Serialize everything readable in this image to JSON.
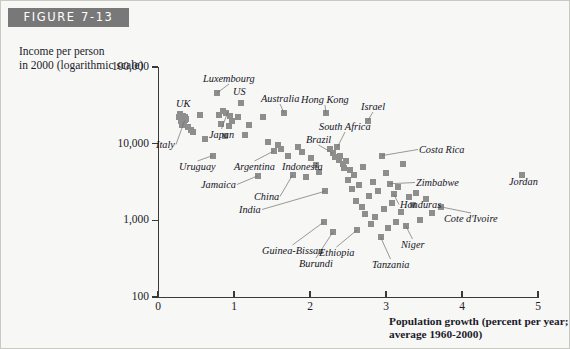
{
  "figure": {
    "badge": "FIGURE 7-13"
  },
  "chart_data": {
    "type": "scatter",
    "title": "FIGURE 7-13",
    "ylabel": "Income per person\nin 2000 (logarithmic scale)",
    "xlabel": "Population growth (percent per year;\naverage 1960-2000)",
    "xlim": [
      0,
      5
    ],
    "ylim": [
      100,
      100000
    ],
    "yscale": "log",
    "grid": false,
    "legend": null,
    "xticks": [
      "0",
      "1",
      "2",
      "3",
      "4",
      "5"
    ],
    "yticks": [
      "100",
      "1,000",
      "10,000",
      "100,000"
    ],
    "marker_color": "#8e8e8e",
    "labeled_points": [
      {
        "name": "Luxembourg",
        "x": 0.78,
        "y": 46000,
        "lx": 202,
        "ly": 72,
        "anchor": "start"
      },
      {
        "name": "UK",
        "x": 0.31,
        "y": 24500,
        "lx": 175,
        "ly": 97,
        "anchor": "start"
      },
      {
        "name": "US",
        "x": 1.09,
        "y": 34000,
        "lx": 232,
        "ly": 85,
        "anchor": "start"
      },
      {
        "name": "Australia",
        "x": 1.66,
        "y": 25000,
        "lx": 260,
        "ly": 92,
        "anchor": "start"
      },
      {
        "name": "Hong Kong",
        "x": 2.21,
        "y": 25000,
        "lx": 300,
        "ly": 93,
        "anchor": "start"
      },
      {
        "name": "Israel",
        "x": 2.76,
        "y": 20000,
        "lx": 360,
        "ly": 100,
        "anchor": "start"
      },
      {
        "name": "Italy",
        "x": 0.35,
        "y": 20000,
        "lx": 155,
        "ly": 138,
        "anchor": "start"
      },
      {
        "name": "Japan",
        "x": 0.92,
        "y": 26000,
        "lx": 208,
        "ly": 128,
        "anchor": "start"
      },
      {
        "name": "South Africa",
        "x": 2.36,
        "y": 9000,
        "lx": 318,
        "ly": 120,
        "anchor": "start"
      },
      {
        "name": "Brazil",
        "x": 2.3,
        "y": 7500,
        "lx": 305,
        "ly": 133,
        "anchor": "start"
      },
      {
        "name": "Costa Rica",
        "x": 2.95,
        "y": 7000,
        "lx": 418,
        "ly": 143,
        "anchor": "start"
      },
      {
        "name": "Uruguay",
        "x": 0.72,
        "y": 7000,
        "lx": 178,
        "ly": 160,
        "anchor": "start"
      },
      {
        "name": "Argentina",
        "x": 1.52,
        "y": 8000,
        "lx": 233,
        "ly": 160,
        "anchor": "start"
      },
      {
        "name": "Indonesia",
        "x": 2.01,
        "y": 6500,
        "lx": 281,
        "ly": 160,
        "anchor": "start"
      },
      {
        "name": "Zimbabwe",
        "x": 3.05,
        "y": 3000,
        "lx": 415,
        "ly": 176,
        "anchor": "start"
      },
      {
        "name": "Jamaica",
        "x": 1.31,
        "y": 3800,
        "lx": 200,
        "ly": 178,
        "anchor": "start"
      },
      {
        "name": "China",
        "x": 1.77,
        "y": 3900,
        "lx": 253,
        "ly": 190,
        "anchor": "start"
      },
      {
        "name": "Jordan",
        "x": 4.79,
        "y": 3900,
        "lx": 508,
        "ly": 175,
        "anchor": "start"
      },
      {
        "name": "Honduras",
        "x": 3.1,
        "y": 2200,
        "lx": 399,
        "ly": 198,
        "anchor": "start"
      },
      {
        "name": "India",
        "x": 2.2,
        "y": 2400,
        "lx": 238,
        "ly": 203,
        "anchor": "start"
      },
      {
        "name": "Cote d'Ivoire",
        "x": 3.72,
        "y": 1500,
        "lx": 443,
        "ly": 212,
        "anchor": "start"
      },
      {
        "name": "Niger",
        "x": 3.26,
        "y": 850,
        "lx": 400,
        "ly": 238,
        "anchor": "start"
      },
      {
        "name": "Guinea-Bissau",
        "x": 2.18,
        "y": 950,
        "lx": 261,
        "ly": 244,
        "anchor": "start"
      },
      {
        "name": "Ethiopia",
        "x": 2.62,
        "y": 750,
        "lx": 318,
        "ly": 246,
        "anchor": "start"
      },
      {
        "name": "Burundi",
        "x": 2.3,
        "y": 700,
        "lx": 298,
        "ly": 257,
        "anchor": "start"
      },
      {
        "name": "Tanzania",
        "x": 2.93,
        "y": 600,
        "lx": 371,
        "ly": 258,
        "anchor": "start"
      }
    ],
    "points": [
      {
        "x": 0.27,
        "y": 22000
      },
      {
        "x": 0.3,
        "y": 19500
      },
      {
        "x": 0.33,
        "y": 23000
      },
      {
        "x": 0.35,
        "y": 20500
      },
      {
        "x": 0.37,
        "y": 21000
      },
      {
        "x": 0.31,
        "y": 17500
      },
      {
        "x": 0.29,
        "y": 24500
      },
      {
        "x": 0.4,
        "y": 16500
      },
      {
        "x": 0.43,
        "y": 15000
      },
      {
        "x": 0.34,
        "y": 18500
      },
      {
        "x": 0.36,
        "y": 22500
      },
      {
        "x": 0.46,
        "y": 14000
      },
      {
        "x": 0.55,
        "y": 24000
      },
      {
        "x": 0.62,
        "y": 11500
      },
      {
        "x": 0.72,
        "y": 7000
      },
      {
        "x": 0.78,
        "y": 46000
      },
      {
        "x": 0.8,
        "y": 24000
      },
      {
        "x": 0.86,
        "y": 26500
      },
      {
        "x": 0.9,
        "y": 25000
      },
      {
        "x": 0.95,
        "y": 23000
      },
      {
        "x": 0.98,
        "y": 20000
      },
      {
        "x": 0.83,
        "y": 18000
      },
      {
        "x": 0.88,
        "y": 12500
      },
      {
        "x": 0.93,
        "y": 17000
      },
      {
        "x": 1.09,
        "y": 34000
      },
      {
        "x": 1.05,
        "y": 22000
      },
      {
        "x": 1.15,
        "y": 13000
      },
      {
        "x": 1.2,
        "y": 17500
      },
      {
        "x": 1.31,
        "y": 3800
      },
      {
        "x": 1.38,
        "y": 22000
      },
      {
        "x": 1.45,
        "y": 10500
      },
      {
        "x": 1.52,
        "y": 8000
      },
      {
        "x": 1.58,
        "y": 9500
      },
      {
        "x": 1.66,
        "y": 25000
      },
      {
        "x": 1.62,
        "y": 8500
      },
      {
        "x": 1.71,
        "y": 7000
      },
      {
        "x": 1.77,
        "y": 3900
      },
      {
        "x": 1.84,
        "y": 9000
      },
      {
        "x": 1.9,
        "y": 7800
      },
      {
        "x": 1.95,
        "y": 3700
      },
      {
        "x": 2.01,
        "y": 6500
      },
      {
        "x": 2.08,
        "y": 5200
      },
      {
        "x": 2.12,
        "y": 4300
      },
      {
        "x": 2.18,
        "y": 950
      },
      {
        "x": 2.2,
        "y": 2400
      },
      {
        "x": 2.21,
        "y": 25000
      },
      {
        "x": 2.26,
        "y": 8500
      },
      {
        "x": 2.3,
        "y": 7500
      },
      {
        "x": 2.3,
        "y": 700
      },
      {
        "x": 2.33,
        "y": 6800
      },
      {
        "x": 2.36,
        "y": 9000
      },
      {
        "x": 2.38,
        "y": 6200
      },
      {
        "x": 2.4,
        "y": 7000
      },
      {
        "x": 2.43,
        "y": 5500
      },
      {
        "x": 2.45,
        "y": 4800
      },
      {
        "x": 2.48,
        "y": 6000
      },
      {
        "x": 2.5,
        "y": 3400
      },
      {
        "x": 2.52,
        "y": 4500
      },
      {
        "x": 2.55,
        "y": 2600
      },
      {
        "x": 2.58,
        "y": 3900
      },
      {
        "x": 2.62,
        "y": 750
      },
      {
        "x": 2.6,
        "y": 1800
      },
      {
        "x": 2.65,
        "y": 2900
      },
      {
        "x": 2.68,
        "y": 1500
      },
      {
        "x": 2.7,
        "y": 5000
      },
      {
        "x": 2.73,
        "y": 1200
      },
      {
        "x": 2.76,
        "y": 20000
      },
      {
        "x": 2.78,
        "y": 2100
      },
      {
        "x": 2.8,
        "y": 900
      },
      {
        "x": 2.83,
        "y": 3200
      },
      {
        "x": 2.86,
        "y": 1100
      },
      {
        "x": 2.9,
        "y": 2400
      },
      {
        "x": 2.93,
        "y": 600
      },
      {
        "x": 2.95,
        "y": 7000
      },
      {
        "x": 2.98,
        "y": 1400
      },
      {
        "x": 3.0,
        "y": 4200
      },
      {
        "x": 3.02,
        "y": 800
      },
      {
        "x": 3.05,
        "y": 3000
      },
      {
        "x": 3.08,
        "y": 1700
      },
      {
        "x": 3.1,
        "y": 2200
      },
      {
        "x": 3.13,
        "y": 950
      },
      {
        "x": 3.16,
        "y": 2700
      },
      {
        "x": 3.2,
        "y": 1300
      },
      {
        "x": 3.22,
        "y": 5500
      },
      {
        "x": 3.26,
        "y": 850
      },
      {
        "x": 3.3,
        "y": 2000
      },
      {
        "x": 3.35,
        "y": 1600
      },
      {
        "x": 3.4,
        "y": 2300
      },
      {
        "x": 3.45,
        "y": 1000
      },
      {
        "x": 3.52,
        "y": 1900
      },
      {
        "x": 3.6,
        "y": 1250
      },
      {
        "x": 3.72,
        "y": 1500
      },
      {
        "x": 4.79,
        "y": 3900
      }
    ]
  }
}
